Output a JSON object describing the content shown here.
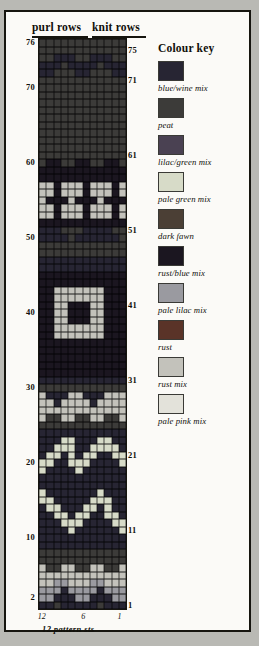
{
  "chart_data": {
    "type": "heatmap",
    "title": "12 pattern sts",
    "subtitle": "Fair Isle knitting colour chart",
    "xlabel": "12 pattern sts",
    "ylabel": "rows",
    "grid": true,
    "columns": 12,
    "rows": 76,
    "column_tick_labels": [
      "12",
      "6",
      "1"
    ],
    "column_ticks": [
      12,
      6,
      1
    ],
    "row_ticks_left": [
      76,
      70,
      60,
      50,
      40,
      30,
      20,
      10,
      2
    ],
    "row_ticks_right": [
      75,
      71,
      61,
      51,
      41,
      31,
      21,
      11,
      1
    ],
    "legend_position": "right",
    "palette": {
      "1": "#272533",
      "2": "#3c3b39",
      "3": "#4a4152",
      "4": "#d7dbc8",
      "5": "#4b3f35",
      "6": "#1b1620",
      "7": "#9a9aa0",
      "8": "#5a3328",
      "9": "#c3c2bb",
      "10": "#e3e2da"
    },
    "matrix": [
      [
        1,
        1,
        2,
        1,
        1,
        1,
        1,
        1,
        2,
        1,
        1,
        1
      ],
      [
        7,
        7,
        1,
        1,
        1,
        7,
        7,
        1,
        1,
        1,
        7,
        7
      ],
      [
        7,
        7,
        7,
        1,
        7,
        7,
        7,
        7,
        1,
        7,
        7,
        7
      ],
      [
        9,
        9,
        7,
        7,
        9,
        9,
        9,
        7,
        7,
        9,
        9,
        9
      ],
      [
        9,
        9,
        9,
        9,
        9,
        9,
        9,
        9,
        9,
        9,
        9,
        9
      ],
      [
        9,
        2,
        2,
        9,
        9,
        2,
        2,
        9,
        9,
        2,
        2,
        9
      ],
      [
        2,
        2,
        2,
        2,
        2,
        2,
        2,
        2,
        2,
        2,
        2,
        2
      ],
      [
        2,
        2,
        2,
        2,
        2,
        2,
        2,
        2,
        2,
        2,
        2,
        2
      ],
      [
        1,
        1,
        1,
        1,
        1,
        1,
        1,
        1,
        1,
        1,
        1,
        1
      ],
      [
        1,
        1,
        1,
        1,
        1,
        1,
        1,
        1,
        1,
        1,
        1,
        1
      ],
      [
        1,
        1,
        1,
        1,
        4,
        1,
        1,
        1,
        1,
        1,
        1,
        4
      ],
      [
        1,
        1,
        1,
        4,
        4,
        4,
        1,
        1,
        1,
        1,
        4,
        4
      ],
      [
        1,
        1,
        4,
        4,
        1,
        4,
        4,
        1,
        1,
        4,
        4,
        1
      ],
      [
        1,
        4,
        4,
        1,
        1,
        1,
        4,
        4,
        1,
        4,
        1,
        1
      ],
      [
        4,
        4,
        1,
        1,
        1,
        1,
        1,
        4,
        4,
        4,
        1,
        1
      ],
      [
        4,
        1,
        1,
        1,
        1,
        1,
        1,
        1,
        4,
        1,
        1,
        1
      ],
      [
        1,
        1,
        1,
        1,
        1,
        1,
        1,
        1,
        1,
        1,
        1,
        1
      ],
      [
        1,
        1,
        1,
        1,
        1,
        1,
        1,
        1,
        1,
        1,
        1,
        1
      ],
      [
        4,
        1,
        1,
        1,
        1,
        4,
        1,
        1,
        1,
        1,
        1,
        1
      ],
      [
        4,
        4,
        1,
        1,
        4,
        4,
        4,
        1,
        1,
        1,
        1,
        4
      ],
      [
        1,
        4,
        4,
        1,
        4,
        1,
        4,
        4,
        1,
        1,
        4,
        4
      ],
      [
        1,
        1,
        4,
        4,
        4,
        1,
        1,
        4,
        4,
        4,
        4,
        1
      ],
      [
        1,
        1,
        1,
        4,
        4,
        1,
        1,
        1,
        4,
        4,
        1,
        1
      ],
      [
        1,
        1,
        1,
        1,
        1,
        1,
        1,
        1,
        1,
        1,
        1,
        1
      ],
      [
        2,
        2,
        2,
        2,
        2,
        2,
        2,
        2,
        2,
        2,
        2,
        2
      ],
      [
        9,
        2,
        2,
        9,
        9,
        2,
        2,
        9,
        9,
        2,
        2,
        9
      ],
      [
        9,
        9,
        9,
        9,
        9,
        9,
        9,
        9,
        9,
        9,
        9,
        9
      ],
      [
        9,
        9,
        1,
        9,
        9,
        9,
        9,
        1,
        9,
        9,
        9,
        9
      ],
      [
        9,
        1,
        1,
        1,
        9,
        9,
        1,
        1,
        1,
        9,
        9,
        9
      ],
      [
        2,
        2,
        2,
        2,
        2,
        2,
        2,
        2,
        2,
        2,
        2,
        2
      ],
      [
        1,
        1,
        1,
        1,
        1,
        1,
        1,
        1,
        1,
        1,
        1,
        1
      ],
      [
        6,
        6,
        6,
        6,
        6,
        6,
        6,
        6,
        6,
        6,
        6,
        6
      ],
      [
        6,
        6,
        6,
        6,
        6,
        6,
        6,
        6,
        6,
        6,
        6,
        6
      ],
      [
        6,
        6,
        6,
        6,
        6,
        6,
        6,
        6,
        6,
        6,
        6,
        6
      ],
      [
        6,
        6,
        6,
        6,
        6,
        6,
        6,
        6,
        6,
        6,
        6,
        6
      ],
      [
        6,
        6,
        6,
        6,
        6,
        6,
        6,
        6,
        6,
        6,
        6,
        6
      ],
      [
        6,
        6,
        9,
        9,
        9,
        9,
        9,
        9,
        9,
        6,
        6,
        6
      ],
      [
        6,
        6,
        9,
        9,
        9,
        9,
        9,
        9,
        9,
        6,
        6,
        6
      ],
      [
        6,
        6,
        9,
        9,
        6,
        6,
        6,
        9,
        9,
        6,
        6,
        6
      ],
      [
        6,
        6,
        9,
        9,
        6,
        6,
        6,
        9,
        9,
        6,
        6,
        6
      ],
      [
        6,
        6,
        9,
        9,
        6,
        6,
        6,
        9,
        9,
        6,
        6,
        6
      ],
      [
        6,
        6,
        9,
        9,
        9,
        9,
        9,
        9,
        9,
        6,
        6,
        6
      ],
      [
        6,
        6,
        9,
        9,
        9,
        9,
        9,
        9,
        9,
        6,
        6,
        6
      ],
      [
        6,
        6,
        6,
        6,
        6,
        6,
        6,
        6,
        6,
        6,
        6,
        6
      ],
      [
        6,
        6,
        6,
        6,
        6,
        6,
        6,
        6,
        6,
        6,
        6,
        6
      ],
      [
        1,
        1,
        1,
        1,
        1,
        1,
        1,
        1,
        1,
        1,
        1,
        1
      ],
      [
        1,
        1,
        1,
        1,
        1,
        1,
        1,
        1,
        1,
        1,
        1,
        1
      ],
      [
        2,
        2,
        2,
        2,
        2,
        2,
        2,
        2,
        2,
        2,
        2,
        2
      ],
      [
        2,
        2,
        2,
        2,
        2,
        2,
        2,
        2,
        2,
        2,
        2,
        2
      ],
      [
        1,
        1,
        1,
        1,
        2,
        1,
        1,
        1,
        1,
        1,
        1,
        2
      ],
      [
        1,
        1,
        1,
        2,
        2,
        2,
        1,
        1,
        1,
        1,
        2,
        2
      ],
      [
        6,
        6,
        6,
        6,
        6,
        6,
        6,
        6,
        6,
        6,
        6,
        6
      ],
      [
        9,
        9,
        6,
        9,
        9,
        9,
        6,
        9,
        9,
        9,
        6,
        9
      ],
      [
        9,
        9,
        6,
        9,
        9,
        9,
        6,
        9,
        9,
        9,
        6,
        9
      ],
      [
        9,
        6,
        6,
        6,
        9,
        6,
        6,
        6,
        9,
        6,
        6,
        6
      ],
      [
        9,
        9,
        6,
        9,
        9,
        9,
        6,
        9,
        9,
        9,
        6,
        9
      ],
      [
        9,
        9,
        6,
        9,
        9,
        9,
        6,
        9,
        9,
        9,
        6,
        9
      ],
      [
        6,
        6,
        6,
        6,
        6,
        6,
        6,
        6,
        6,
        6,
        6,
        6
      ],
      [
        6,
        6,
        6,
        6,
        6,
        6,
        6,
        6,
        6,
        6,
        6,
        6
      ],
      [
        2,
        6,
        6,
        2,
        2,
        6,
        6,
        2,
        2,
        6,
        6,
        2
      ],
      [
        2,
        2,
        2,
        2,
        2,
        2,
        2,
        2,
        2,
        2,
        2,
        2
      ],
      [
        2,
        2,
        2,
        2,
        2,
        2,
        2,
        2,
        2,
        2,
        2,
        2
      ],
      [
        2,
        2,
        2,
        2,
        2,
        2,
        2,
        2,
        2,
        2,
        2,
        2
      ],
      [
        2,
        2,
        2,
        2,
        2,
        2,
        2,
        2,
        2,
        2,
        2,
        2
      ],
      [
        2,
        2,
        2,
        2,
        2,
        2,
        2,
        2,
        2,
        2,
        2,
        2
      ],
      [
        2,
        2,
        2,
        2,
        2,
        2,
        2,
        2,
        2,
        2,
        2,
        2
      ],
      [
        2,
        2,
        2,
        2,
        2,
        2,
        2,
        2,
        2,
        2,
        2,
        2
      ],
      [
        2,
        2,
        2,
        2,
        2,
        2,
        2,
        2,
        2,
        2,
        2,
        2
      ],
      [
        2,
        2,
        2,
        2,
        2,
        2,
        2,
        2,
        2,
        2,
        2,
        2
      ],
      [
        2,
        2,
        2,
        2,
        2,
        2,
        2,
        2,
        2,
        2,
        2,
        2
      ],
      [
        2,
        2,
        2,
        2,
        2,
        2,
        2,
        2,
        2,
        2,
        2,
        2
      ],
      [
        1,
        1,
        2,
        2,
        2,
        1,
        1,
        2,
        2,
        2,
        1,
        1
      ],
      [
        1,
        1,
        1,
        2,
        1,
        1,
        1,
        1,
        2,
        1,
        1,
        1
      ],
      [
        2,
        2,
        1,
        1,
        1,
        2,
        2,
        1,
        1,
        1,
        2,
        2
      ],
      [
        2,
        2,
        2,
        2,
        2,
        2,
        2,
        2,
        2,
        2,
        2,
        2
      ],
      [
        2,
        2,
        2,
        2,
        2,
        2,
        2,
        2,
        2,
        2,
        2,
        2
      ]
    ]
  },
  "headers": {
    "purl_rows": "purl rows",
    "knit_rows": "knit rows"
  },
  "key": {
    "title": "Colour key",
    "entries": [
      {
        "label": "blue/wine mix",
        "color": "#272533"
      },
      {
        "label": "peat",
        "color": "#3c3b39"
      },
      {
        "label": "lilac/green mix",
        "color": "#4a4152"
      },
      {
        "label": "pale green mix",
        "color": "#d7dbc8"
      },
      {
        "label": "dark fawn",
        "color": "#4b3f35"
      },
      {
        "label": "rust/blue mix",
        "color": "#1b1620"
      },
      {
        "label": "pale lilac mix",
        "color": "#9a9aa0"
      },
      {
        "label": "rust",
        "color": "#5a3328"
      },
      {
        "label": "rust mix",
        "color": "#c3c2bb"
      },
      {
        "label": "pale pink mix",
        "color": "#e3e2da"
      }
    ]
  },
  "caption": "12 pattern sts"
}
